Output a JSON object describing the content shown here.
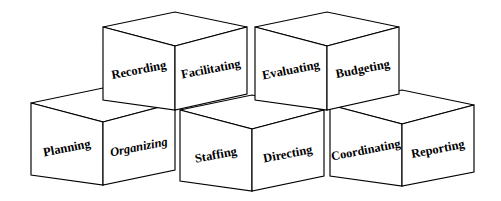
{
  "diagram": {
    "name": "POSDCORB management functions cubes",
    "background_color": "#ffffff",
    "line_color": "#000000",
    "face_fill": "#ffffff",
    "text_color": "#000000",
    "label_rotation_degrees": -11,
    "cubes": [
      {
        "id": "cube-top-left",
        "row": "top",
        "position": 1,
        "left_face_label": "Recording",
        "right_face_label": "Facilitating"
      },
      {
        "id": "cube-top-right",
        "row": "top",
        "position": 2,
        "left_face_label": "Evaluating",
        "right_face_label": "Budgeting"
      },
      {
        "id": "cube-bottom-left",
        "row": "bottom",
        "position": 1,
        "left_face_label": "Planning",
        "right_face_label": "Organizing"
      },
      {
        "id": "cube-bottom-middle",
        "row": "bottom",
        "position": 2,
        "left_face_label": "Staffing",
        "right_face_label": "Directing"
      },
      {
        "id": "cube-bottom-right",
        "row": "bottom",
        "position": 3,
        "left_face_label": "Coordinating",
        "right_face_label": "Reporting"
      }
    ]
  }
}
